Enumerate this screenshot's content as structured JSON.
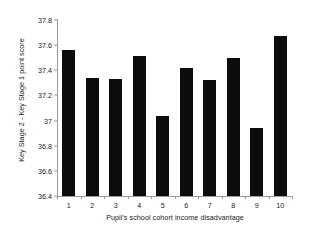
{
  "chart_data": {
    "type": "bar",
    "title": "",
    "xlabel": "Pupil's school cohort income disadvantage",
    "ylabel": "Key Stage 2 - Key Stage 1 point score",
    "categories": [
      "1",
      "2",
      "3",
      "4",
      "5",
      "6",
      "7",
      "8",
      "9",
      "10"
    ],
    "values": [
      37.56,
      37.34,
      37.33,
      37.51,
      37.04,
      37.42,
      37.32,
      37.5,
      36.94,
      37.67
    ],
    "series": [
      {
        "name": "Key Stage 2 - Key Stage 1 point score",
        "values": [
          37.56,
          37.34,
          37.33,
          37.51,
          37.04,
          37.42,
          37.32,
          37.5,
          36.94,
          37.67
        ]
      }
    ],
    "ylim": [
      36.4,
      37.8
    ],
    "ytick_labels": [
      "37.8",
      "37.6",
      "37.4",
      "37.2",
      "37",
      "36.8",
      "36.6",
      "36.4"
    ],
    "ytick_values": [
      37.8,
      37.6,
      37.4,
      37.2,
      37.0,
      36.8,
      36.6,
      36.4
    ],
    "grid": false,
    "legend": false,
    "legend_position": "none",
    "bar_color": "#0d0d0d",
    "axis_color": "#9a9a9a",
    "text_color": "#1a1a1a",
    "background_color": "#ffffff"
  }
}
